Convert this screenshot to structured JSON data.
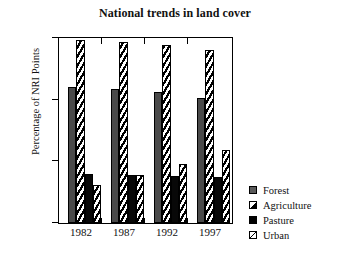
{
  "chart_data": {
    "type": "bar",
    "title": "National trends in land cover",
    "xlabel": "",
    "ylabel": "Percentage of NRI Points",
    "categories": [
      "1982",
      "1987",
      "1992",
      "1997"
    ],
    "ylim": [
      0,
      30
    ],
    "yticks": [
      0,
      10,
      20,
      30
    ],
    "ytick_labels": [
      "0",
      "10",
      "20",
      "30"
    ],
    "grid": false,
    "legend_position": "right",
    "series": [
      {
        "name": "Forest",
        "pattern": "solid-gray",
        "values": [
          22.0,
          21.8,
          21.2,
          20.3
        ]
      },
      {
        "name": "Agriculture",
        "pattern": "diagonal-hatch",
        "values": [
          29.7,
          29.4,
          28.8,
          28.0
        ]
      },
      {
        "name": "Pasture",
        "pattern": "solid-black",
        "values": [
          8.0,
          7.8,
          7.6,
          7.4
        ]
      },
      {
        "name": "Urban",
        "pattern": "diagonal-hatch",
        "values": [
          6.2,
          7.8,
          9.5,
          11.8
        ]
      }
    ]
  },
  "chart": {
    "title": "National trends in land cover",
    "y_axis_label": "Percentage of NRI Points",
    "y_tick_labels": [
      "30",
      "20",
      "10",
      "0"
    ],
    "x_tick_labels": [
      "1982",
      "1987",
      "1992",
      "1997"
    ]
  },
  "legend": {
    "items": [
      {
        "label": "Forest",
        "swatch": "solid-gray-swatch-icon"
      },
      {
        "label": "Agriculture",
        "swatch": "half-diagonal-swatch-icon"
      },
      {
        "label": "Pasture",
        "swatch": "solid-black-swatch-icon"
      },
      {
        "label": "Urban",
        "swatch": "diagonal-line-swatch-icon"
      }
    ]
  },
  "colors": {
    "forest": "#4a4a4a",
    "pasture": "#080808",
    "hatch": "#000000",
    "background": "#ffffff",
    "axis": "#000000"
  }
}
